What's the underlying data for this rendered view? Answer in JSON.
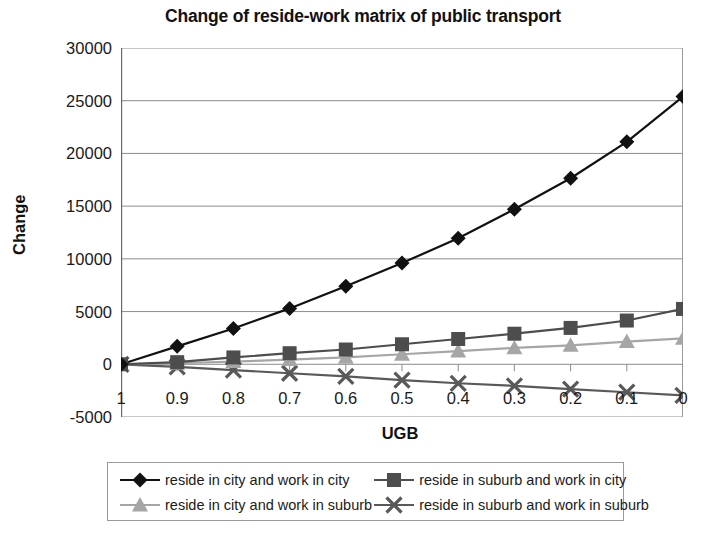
{
  "chart_data": {
    "type": "line",
    "title": "Change of reside-work matrix of public transport",
    "xlabel": "UGB",
    "ylabel": "Change",
    "categories": [
      "1",
      "0.9",
      "0.8",
      "0.7",
      "0.6",
      "0.5",
      "0.4",
      "0.3",
      "0.2",
      "0.1",
      "0"
    ],
    "x": [
      1,
      0.9,
      0.8,
      0.7,
      0.6,
      0.5,
      0.4,
      0.3,
      0.2,
      0.1,
      0
    ],
    "ylim": [
      -5000,
      30000
    ],
    "ytick_labels": [
      "30000",
      "25000",
      "20000",
      "15000",
      "10000",
      "5000",
      "0",
      "-5000"
    ],
    "yticks": [
      30000,
      25000,
      20000,
      15000,
      10000,
      5000,
      0,
      -5000
    ],
    "grid": "horizontal",
    "legend_position": "bottom",
    "series": [
      {
        "name": "reside in city and work in city",
        "marker": "diamond",
        "color": "#111111",
        "values": [
          0,
          1700,
          3400,
          5300,
          7400,
          9600,
          11950,
          14700,
          17650,
          21100,
          25400
        ]
      },
      {
        "name": "reside in suburb and work in city",
        "marker": "square",
        "color": "#4d4d4d",
        "values": [
          0,
          200,
          650,
          1050,
          1400,
          1900,
          2400,
          2900,
          3450,
          4150,
          5250
        ]
      },
      {
        "name": "reside in city and work in suburb",
        "marker": "triangle",
        "color": "#a6a6a6",
        "values": [
          0,
          100,
          250,
          450,
          650,
          950,
          1250,
          1550,
          1800,
          2150,
          2450
        ]
      },
      {
        "name": "reside in suburb and work in suburb",
        "marker": "cross",
        "color": "#595959",
        "values": [
          0,
          -250,
          -550,
          -850,
          -1150,
          -1500,
          -1800,
          -2050,
          -2350,
          -2650,
          -2950
        ]
      }
    ]
  },
  "legend": {
    "items": [
      "reside in city and work in city",
      "reside in suburb and work in city",
      "reside in city and work in suburb",
      "reside in suburb and work in suburb"
    ]
  }
}
